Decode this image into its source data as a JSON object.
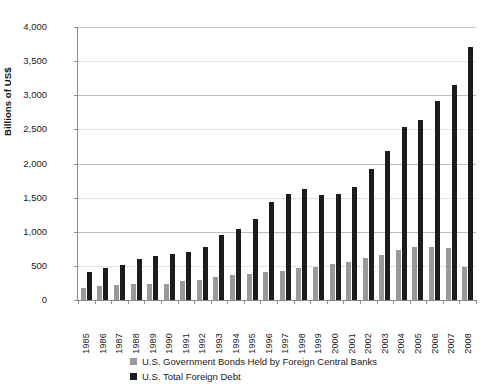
{
  "chart_data": {
    "type": "bar",
    "title": "",
    "subtitle": "",
    "xlabel": "",
    "ylabel": "Billions of US$",
    "ylim": [
      0,
      4000
    ],
    "ytick_values": [
      0,
      500,
      1000,
      1500,
      2000,
      2500,
      3000,
      3500,
      4000
    ],
    "ytick_labels": [
      "0",
      "500",
      "1,000",
      "1,500",
      "2,000",
      "2,500",
      "3,000",
      "3,500",
      "4,000"
    ],
    "grid": true,
    "grid_axis": "y",
    "legend_position": "bottom",
    "categories": [
      "1985",
      "1986",
      "1987",
      "1988",
      "1989",
      "1990",
      "1991",
      "1992",
      "1993",
      "1994",
      "1995",
      "1996",
      "1997",
      "1998",
      "1999",
      "2000",
      "2001",
      "2002",
      "2003",
      "2004",
      "2005",
      "2006",
      "2007",
      "2008"
    ],
    "series": [
      {
        "name": "U.S. Government Bonds Held by Foreign Central Banks",
        "color": "#999999",
        "values": [
          170,
          200,
          220,
          240,
          235,
          240,
          275,
          300,
          340,
          360,
          385,
          405,
          430,
          470,
          485,
          530,
          550,
          615,
          665,
          735,
          770,
          780,
          760,
          490
        ]
      },
      {
        "name": "U.S. Total Foreign Debt",
        "color": "#1c1c1c",
        "values": [
          410,
          470,
          520,
          600,
          650,
          670,
          700,
          770,
          950,
          1040,
          1180,
          1440,
          1560,
          1620,
          1545,
          1550,
          1660,
          1915,
          2190,
          2540,
          2640,
          2920,
          3150,
          3700
        ]
      }
    ],
    "annotations": []
  },
  "legend": {
    "items": [
      {
        "label": "U.S. Government Bonds Held by Foreign Central Banks",
        "swatch": "gov"
      },
      {
        "label": "U.S. Total Foreign Debt",
        "swatch": "debt"
      }
    ]
  }
}
